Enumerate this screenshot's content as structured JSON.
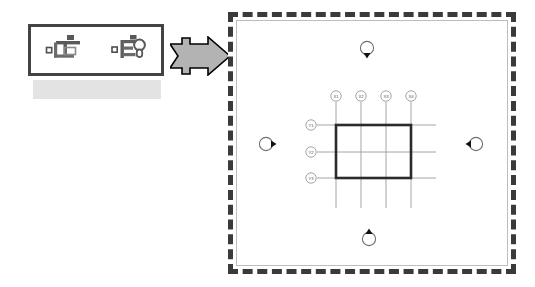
{
  "toolbar": {
    "name": "grid-tools-toolbar",
    "border_color": "#434343",
    "shadow_color": "#e3e3e3",
    "buttons": [
      {
        "id": "grid-tool",
        "icon": "grid-line-icon",
        "label": "Grid"
      },
      {
        "id": "level-tool",
        "icon": "level-marker-icon",
        "label": "Level"
      }
    ]
  },
  "arrow": {
    "name": "flow-arrow",
    "direction": "right",
    "fill": "#b3b3b3",
    "stroke": "#000000"
  },
  "panel": {
    "name": "drawing-canvas",
    "border_style": "dashed",
    "border_color": "#3a3a3a",
    "background": "#ffffff"
  },
  "drawing": {
    "grid_line_color": "#9a9a9a",
    "outline_color": "#2b2b2b",
    "bubble_fill": "#ffffff",
    "bubble_stroke": "#8d8d8d",
    "x_gridlines": [
      {
        "label": "X1",
        "cx": 108,
        "cy": 84,
        "x": 108,
        "y_top": 90,
        "y_bottom": 196
      },
      {
        "label": "X2",
        "cx": 133,
        "cy": 84,
        "x": 133,
        "y_top": 90,
        "y_bottom": 196
      },
      {
        "label": "X3",
        "cx": 158,
        "cy": 84,
        "x": 158,
        "y_top": 90,
        "y_bottom": 196
      },
      {
        "label": "X4",
        "cx": 183,
        "cy": 84,
        "x": 183,
        "y_top": 90,
        "y_bottom": 196
      }
    ],
    "y_gridlines": [
      {
        "label": "Y1",
        "cx": 83,
        "cy": 113,
        "y": 113,
        "x_left": 89,
        "x_right": 208
      },
      {
        "label": "Y2",
        "cx": 83,
        "cy": 140,
        "y": 140,
        "x_left": 89,
        "x_right": 208
      },
      {
        "label": "Y3",
        "cx": 83,
        "cy": 166,
        "y": 166,
        "x_left": 89,
        "x_right": 208
      }
    ],
    "plan_rectangle": {
      "x": 108,
      "y": 113,
      "width": 75,
      "height": 53
    },
    "elevation_markers": [
      {
        "id": "elevation-marker-north",
        "cx": 139,
        "cy": 36,
        "points": "down"
      },
      {
        "id": "elevation-marker-south",
        "cx": 141,
        "cy": 227,
        "points": "up"
      },
      {
        "id": "elevation-marker-west",
        "cx": 38,
        "cy": 132,
        "points": "right"
      },
      {
        "id": "elevation-marker-east",
        "cx": 248,
        "cy": 132,
        "points": "left"
      }
    ]
  }
}
